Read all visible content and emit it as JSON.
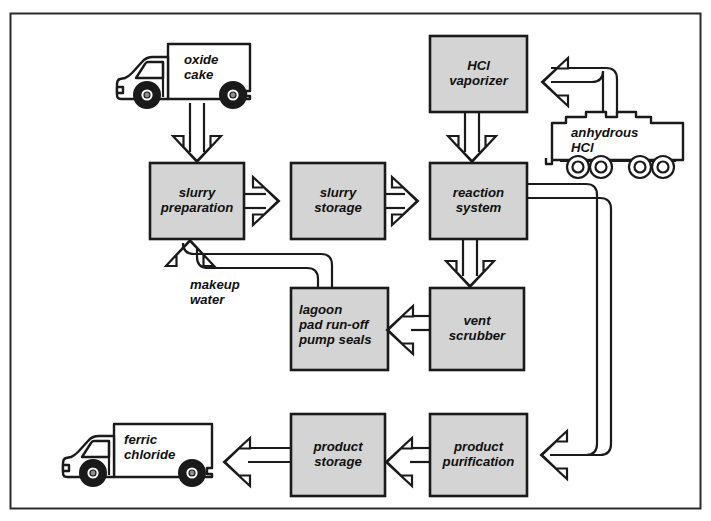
{
  "diagram": {
    "border_color": "#2b2b2b",
    "background_color": "#ffffff",
    "box_fill_color": "#d4d4d4",
    "box_stroke_color": "#1a1a1a",
    "line_color": "#1a1a1a",
    "text_color": "#101010"
  },
  "process_boxes": [
    {
      "id": "hcl-vaporizer",
      "label": "HCl\nvaporizer",
      "x": 430,
      "y": 36,
      "w": 97,
      "h": 76,
      "align": "center"
    },
    {
      "id": "slurry-preparation",
      "label": "slurry\npreparation",
      "x": 150,
      "y": 163,
      "w": 94,
      "h": 76,
      "align": "center"
    },
    {
      "id": "slurry-storage",
      "label": "slurry\nstorage",
      "x": 291,
      "y": 163,
      "w": 94,
      "h": 76,
      "align": "center"
    },
    {
      "id": "reaction-system",
      "label": "reaction\nsystem",
      "x": 430,
      "y": 163,
      "w": 97,
      "h": 76,
      "align": "center"
    },
    {
      "id": "lagoon",
      "label": "lagoon\npad run-off\npump seals",
      "x": 291,
      "y": 288,
      "w": 97,
      "h": 82,
      "align": "left"
    },
    {
      "id": "vent-scrubber",
      "label": "vent\nscrubber",
      "x": 430,
      "y": 288,
      "w": 94,
      "h": 82,
      "align": "center"
    },
    {
      "id": "product-storage",
      "label": "product\nstorage",
      "x": 291,
      "y": 414,
      "w": 94,
      "h": 82,
      "align": "center"
    },
    {
      "id": "product-purification",
      "label": "product\npurification",
      "x": 430,
      "y": 414,
      "w": 97,
      "h": 82,
      "align": "center"
    }
  ],
  "vehicles": [
    {
      "id": "oxide-cake-truck",
      "type": "box-truck",
      "label": "oxide\ncake",
      "x": 113,
      "y": 41,
      "w": 140,
      "h": 62
    },
    {
      "id": "anhydrous-hcl-tankcar",
      "type": "tank-car",
      "label": "anhydrous\nHCl",
      "x": 548,
      "y": 113,
      "w": 140,
      "h": 62
    },
    {
      "id": "ferric-chloride-truck",
      "type": "box-truck",
      "label": "ferric\nchloride",
      "x": 62,
      "y": 420,
      "w": 152,
      "h": 62
    }
  ],
  "stream_labels": [
    {
      "id": "makeup-water",
      "text": "makeup\nwater",
      "x": 190,
      "y": 278
    }
  ],
  "flows": [
    {
      "id": "flow-oxide-cake-to-slurry-prep",
      "from": "oxide-cake-truck",
      "to": "slurry-preparation",
      "direction": "down"
    },
    {
      "id": "flow-slurry-prep-to-slurry-storage",
      "from": "slurry-preparation",
      "to": "slurry-storage",
      "direction": "right"
    },
    {
      "id": "flow-slurry-storage-to-reaction",
      "from": "slurry-storage",
      "to": "reaction-system",
      "direction": "right"
    },
    {
      "id": "flow-hcl-vaporizer-to-reaction",
      "from": "hcl-vaporizer",
      "to": "reaction-system",
      "direction": "down"
    },
    {
      "id": "flow-tankcar-to-hcl-vaporizer",
      "from": "anhydrous-hcl-tankcar",
      "to": "hcl-vaporizer",
      "direction": "left"
    },
    {
      "id": "flow-reaction-to-vent-scrubber",
      "from": "reaction-system",
      "to": "vent-scrubber",
      "direction": "down"
    },
    {
      "id": "flow-vent-scrubber-to-lagoon",
      "from": "vent-scrubber",
      "to": "lagoon",
      "direction": "left"
    },
    {
      "id": "flow-lagoon-to-slurry-prep",
      "from": "lagoon",
      "to": "slurry-preparation",
      "direction": "up",
      "label": "makeup water"
    },
    {
      "id": "flow-reaction-to-product-purification",
      "from": "reaction-system",
      "to": "product-purification",
      "direction": "left"
    },
    {
      "id": "flow-purification-to-product-storage",
      "from": "product-purification",
      "to": "product-storage",
      "direction": "left"
    },
    {
      "id": "flow-product-storage-to-truck",
      "from": "product-storage",
      "to": "ferric-chloride-truck",
      "direction": "left"
    }
  ]
}
